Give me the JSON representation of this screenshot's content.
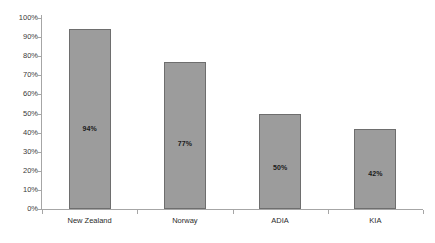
{
  "chart_data": {
    "type": "bar",
    "title": "",
    "xlabel": "",
    "ylabel": "",
    "categories": [
      "New Zealand",
      "Norway",
      "ADIA",
      "KIA"
    ],
    "values": [
      94,
      77,
      50,
      42
    ],
    "data_labels": [
      "94%",
      "77%",
      "50%",
      "42%"
    ],
    "ylim": [
      0,
      100
    ],
    "y_tick_labels": [
      "100%",
      "90%",
      "80%",
      "70%",
      "60%",
      "50%",
      "40%",
      "30%",
      "20%",
      "10%",
      "0%"
    ],
    "y_tick_values": [
      100,
      90,
      80,
      70,
      60,
      50,
      40,
      30,
      20,
      10,
      0
    ],
    "grid": false,
    "legend": false,
    "legend_position": "none",
    "bar_fill_color": "#9c9c9c",
    "bar_border_color": "#6e6e6e",
    "axis_color": "#a6a6a6",
    "background_color": "#ffffff",
    "value_unit": "%"
  },
  "title_fragment": ""
}
